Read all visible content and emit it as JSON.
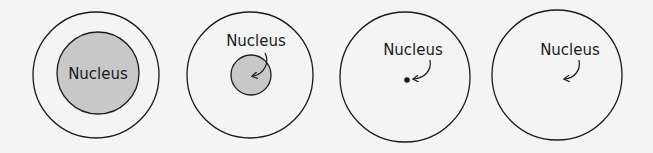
{
  "diagram": {
    "background": "#f4f4f4",
    "stroke_color": "#1a1a1a",
    "nucleus_fill": "#c8c8c8",
    "panels": [
      {
        "label": "Nucleus",
        "nucleus_size": "large"
      },
      {
        "label": "Nucleus",
        "nucleus_size": "medium"
      },
      {
        "label": "Nucleus",
        "nucleus_size": "dot"
      },
      {
        "label": "Nucleus",
        "nucleus_size": "none"
      }
    ]
  }
}
